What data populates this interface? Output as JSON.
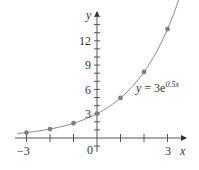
{
  "chart_data": {
    "type": "scatter",
    "title": "",
    "xlabel": "x",
    "ylabel": "y",
    "xlim": [
      -3.6,
      3.9
    ],
    "ylim": [
      -1.2,
      16
    ],
    "grid": false,
    "x_ticks": [
      -3,
      -2,
      -1,
      0,
      1,
      2,
      3
    ],
    "x_tick_labels": [
      "−3",
      "0",
      "3"
    ],
    "x_tick_label_values": [
      -3,
      0,
      3
    ],
    "y_ticks_minor_step": 1,
    "y_tick_labels": [
      "3",
      "6",
      "9",
      "12"
    ],
    "y_tick_label_values": [
      3,
      6,
      9,
      12
    ],
    "series": [
      {
        "name": "data points",
        "kind": "scatter",
        "x": [
          -3,
          -2,
          -1,
          0,
          1,
          2,
          3
        ],
        "y": [
          0.67,
          1.1,
          1.82,
          3.0,
          4.95,
          8.15,
          13.45
        ],
        "color": "#808080"
      },
      {
        "name": "y = 3e^(0.5x)",
        "kind": "line",
        "function": "3*exp(0.5*x)",
        "x_range": [
          -3.4,
          3.6
        ],
        "color": "#8a8a8a"
      }
    ],
    "annotations": [
      {
        "text": "y = 3e^{0.5x}",
        "x": 1.7,
        "y": 5.8
      }
    ]
  },
  "labels": {
    "x_axis": "x",
    "y_axis": "y",
    "origin": "0",
    "xt_neg3": "−3",
    "xt_3": "3",
    "yt_3": "3",
    "yt_6": "6",
    "yt_9": "9",
    "yt_12": "12",
    "eq_lhs": "y",
    "eq_mid": " = 3e",
    "eq_exp": "0.5x"
  }
}
